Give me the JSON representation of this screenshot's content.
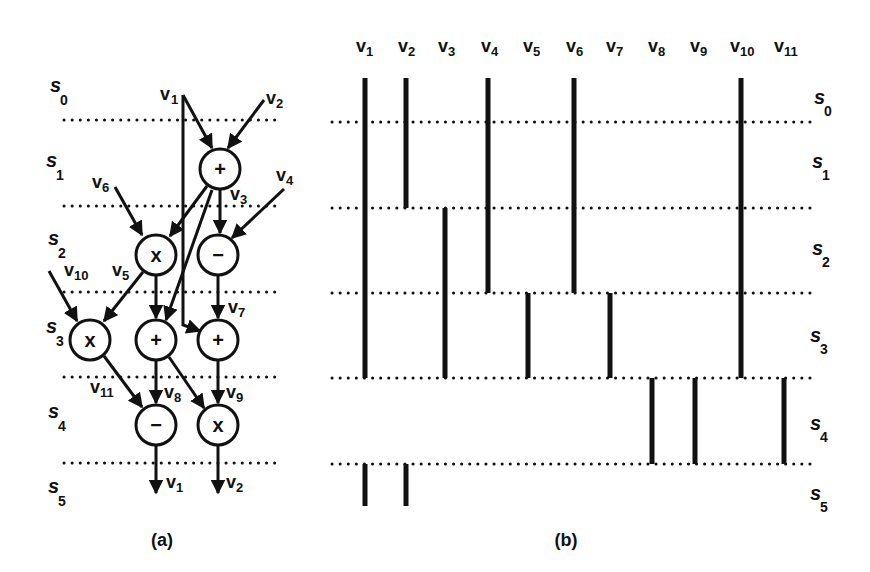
{
  "colors": {
    "ink": "#111111",
    "background": "#ffffff"
  },
  "steps": [
    "s0",
    "s1",
    "s2",
    "s3",
    "s4",
    "s5"
  ],
  "panel_a": {
    "caption": "(a)",
    "step_labels": [
      {
        "base": "s",
        "sub": "0"
      },
      {
        "base": "s",
        "sub": "1"
      },
      {
        "base": "s",
        "sub": "2"
      },
      {
        "base": "s",
        "sub": "3"
      },
      {
        "base": "s",
        "sub": "4"
      },
      {
        "base": "s",
        "sub": "5"
      }
    ],
    "nodes": [
      {
        "id": "n1",
        "op": "+",
        "step": "s1"
      },
      {
        "id": "n2",
        "op": "x",
        "step": "s2"
      },
      {
        "id": "n3",
        "op": "−",
        "step": "s2"
      },
      {
        "id": "n4",
        "op": "x",
        "step": "s3"
      },
      {
        "id": "n5",
        "op": "+",
        "step": "s3"
      },
      {
        "id": "n6",
        "op": "+",
        "step": "s3"
      },
      {
        "id": "n7",
        "op": "−",
        "step": "s4"
      },
      {
        "id": "n8",
        "op": "x",
        "step": "s4"
      }
    ],
    "edge_labels": [
      {
        "base": "v",
        "sub": "1"
      },
      {
        "base": "v",
        "sub": "2"
      },
      {
        "base": "v",
        "sub": "3"
      },
      {
        "base": "v",
        "sub": "4"
      },
      {
        "base": "v",
        "sub": "5"
      },
      {
        "base": "v",
        "sub": "6"
      },
      {
        "base": "v",
        "sub": "7"
      },
      {
        "base": "v",
        "sub": "8"
      },
      {
        "base": "v",
        "sub": "9"
      },
      {
        "base": "v",
        "sub": "10"
      },
      {
        "base": "v",
        "sub": "11"
      }
    ],
    "outputs": [
      {
        "base": "v",
        "sub": "1"
      },
      {
        "base": "v",
        "sub": "2"
      }
    ]
  },
  "panel_b": {
    "caption": "(b)",
    "columns": [
      {
        "base": "v",
        "sub": "1"
      },
      {
        "base": "v",
        "sub": "2"
      },
      {
        "base": "v",
        "sub": "3"
      },
      {
        "base": "v",
        "sub": "4"
      },
      {
        "base": "v",
        "sub": "5"
      },
      {
        "base": "v",
        "sub": "6"
      },
      {
        "base": "v",
        "sub": "7"
      },
      {
        "base": "v",
        "sub": "8"
      },
      {
        "base": "v",
        "sub": "9"
      },
      {
        "base": "v",
        "sub": "10"
      },
      {
        "base": "v",
        "sub": "11"
      }
    ],
    "step_labels": [
      {
        "base": "s",
        "sub": "0"
      },
      {
        "base": "s",
        "sub": "1"
      },
      {
        "base": "s",
        "sub": "2"
      },
      {
        "base": "s",
        "sub": "3"
      },
      {
        "base": "s",
        "sub": "4"
      },
      {
        "base": "s",
        "sub": "5"
      }
    ],
    "lifetimes": [
      {
        "var": "v1",
        "from": "s0",
        "to": "s3"
      },
      {
        "var": "v1",
        "from": "s5",
        "to": "s5"
      },
      {
        "var": "v2",
        "from": "s0",
        "to": "s1"
      },
      {
        "var": "v2",
        "from": "s5",
        "to": "s5"
      },
      {
        "var": "v3",
        "from": "s2",
        "to": "s3"
      },
      {
        "var": "v4",
        "from": "s0",
        "to": "s2"
      },
      {
        "var": "v5",
        "from": "s3",
        "to": "s3"
      },
      {
        "var": "v6",
        "from": "s0",
        "to": "s2"
      },
      {
        "var": "v7",
        "from": "s3",
        "to": "s3"
      },
      {
        "var": "v8",
        "from": "s4",
        "to": "s4"
      },
      {
        "var": "v9",
        "from": "s4",
        "to": "s4"
      },
      {
        "var": "v10",
        "from": "s0",
        "to": "s3"
      },
      {
        "var": "v11",
        "from": "s4",
        "to": "s4"
      }
    ]
  }
}
